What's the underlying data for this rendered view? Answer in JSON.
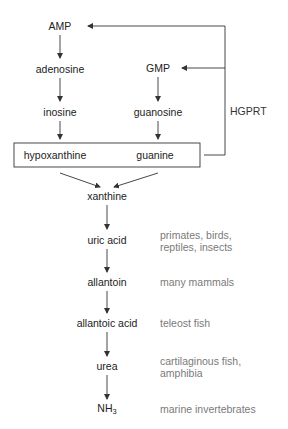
{
  "diagram": {
    "type": "purine degradation pathway",
    "nodes": {
      "amp": "AMP",
      "adenosine": "adenosine",
      "inosine": "inosine",
      "gmp": "GMP",
      "guanosine": "guanosine",
      "hypoxanthine": "hypoxanthine",
      "guanine": "guanine",
      "xanthine": "xanthine",
      "uric_acid": "uric acid",
      "allantoin": "allantoin",
      "allantoic_acid": "allantoic acid",
      "urea": "urea",
      "nh3_base": "NH",
      "nh3_sub": "3"
    },
    "enzyme": "HGPRT",
    "organisms": {
      "uric_acid": [
        "primates, birds,",
        "reptiles, insects"
      ],
      "allantoin": [
        "many mammals"
      ],
      "allantoic_acid": [
        "teleost fish"
      ],
      "urea": [
        "cartilaginous fish,",
        "amphibia"
      ],
      "nh3": [
        "marine invertebrates"
      ]
    },
    "edges": [
      [
        "AMP",
        "adenosine"
      ],
      [
        "adenosine",
        "inosine"
      ],
      [
        "inosine",
        "hypoxanthine"
      ],
      [
        "GMP",
        "guanosine"
      ],
      [
        "guanosine",
        "guanine"
      ],
      [
        "hypoxanthine",
        "xanthine"
      ],
      [
        "guanine",
        "xanthine"
      ],
      [
        "xanthine",
        "uric acid"
      ],
      [
        "uric acid",
        "allantoin"
      ],
      [
        "allantoin",
        "allantoic acid"
      ],
      [
        "allantoic acid",
        "urea"
      ],
      [
        "urea",
        "NH3"
      ],
      [
        "hypoxanthine/guanine",
        "AMP",
        "HGPRT salvage"
      ],
      [
        "hypoxanthine/guanine",
        "GMP",
        "HGPRT salvage"
      ]
    ],
    "colors": {
      "line": "#333333",
      "node_text": "#222222",
      "organism_text": "#7a7a7a"
    }
  }
}
